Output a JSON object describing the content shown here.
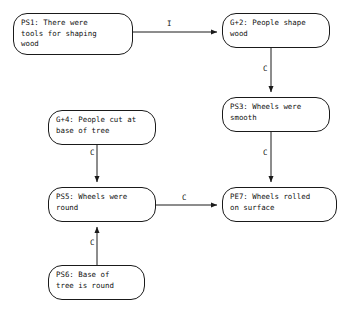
{
  "diagram": {
    "background_color": "#ffffff",
    "node_border_color": "#1a1a1a",
    "text_color": "#111111",
    "edge_color": "#1a1a1a",
    "nodes": [
      {
        "id": "PS1",
        "label": "PS1: There were\ntools for shaping\nwood"
      },
      {
        "id": "G2",
        "label": "G+2: People shape\nwood"
      },
      {
        "id": "PS3",
        "label": "PS3: Wheels were\nsmooth"
      },
      {
        "id": "G4",
        "label": "G+4: People cut at\nbase of tree"
      },
      {
        "id": "PS5",
        "label": "PS5: Wheels were\nround"
      },
      {
        "id": "PE7",
        "label": "PE7: Wheels rolled\non surface"
      },
      {
        "id": "PS6",
        "label": "PS6: Base of\ntree is round"
      }
    ],
    "edges": [
      {
        "id": "ps1-g2",
        "from": "PS1",
        "to": "G2",
        "label": "I"
      },
      {
        "id": "g2-ps3",
        "from": "G2",
        "to": "PS3",
        "label": "C"
      },
      {
        "id": "ps3-pe7",
        "from": "PS3",
        "to": "PE7",
        "label": "C"
      },
      {
        "id": "g4-ps5",
        "from": "G4",
        "to": "PS5",
        "label": "C"
      },
      {
        "id": "ps5-pe7",
        "from": "PS5",
        "to": "PE7",
        "label": "C"
      },
      {
        "id": "ps6-ps5",
        "from": "PS6",
        "to": "PS5",
        "label": "C"
      }
    ]
  }
}
